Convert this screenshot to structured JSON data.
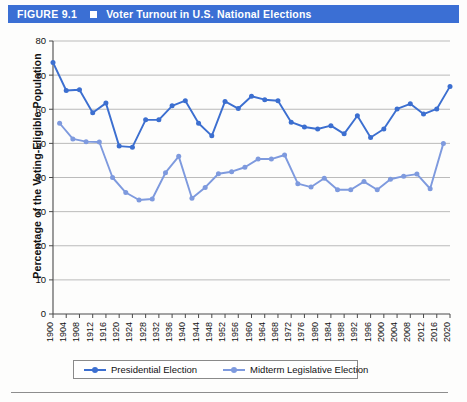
{
  "header": {
    "figure_number": "FIGURE 9.1",
    "marker_icon": "filled-square-icon",
    "title": "Voter Turnout in U.S. National Elections",
    "bar_color": "#3b6fd4"
  },
  "legend": {
    "position": "bottom-center",
    "entries": [
      {
        "label": "Presidential Election",
        "color": "#3c6fd0"
      },
      {
        "label": "Midterm Legislative Election",
        "color": "#7e9ade"
      }
    ]
  },
  "chart_data": {
    "type": "line",
    "title": "Voter Turnout in U.S. National Elections",
    "xlabel": "",
    "ylabel": "Percentage of the Voting-Eligible Population",
    "ylim": [
      0,
      80
    ],
    "ytick_step": 10,
    "yticks": [
      0,
      10,
      20,
      30,
      40,
      50,
      60,
      70,
      80
    ],
    "grid": "horizontal",
    "x": [
      1900,
      1904,
      1908,
      1912,
      1916,
      1920,
      1924,
      1928,
      1932,
      1936,
      1940,
      1944,
      1948,
      1952,
      1956,
      1960,
      1964,
      1968,
      1972,
      1976,
      1980,
      1984,
      1988,
      1992,
      1996,
      2000,
      2004,
      2008,
      2012,
      2016,
      2020
    ],
    "xticks": [
      1900,
      1904,
      1908,
      1912,
      1916,
      1920,
      1924,
      1928,
      1932,
      1936,
      1940,
      1944,
      1948,
      1952,
      1956,
      1960,
      1964,
      1968,
      1972,
      1976,
      1980,
      1984,
      1988,
      1992,
      1996,
      2000,
      2004,
      2008,
      2012,
      2016,
      2020
    ],
    "series": [
      {
        "name": "Presidential Election",
        "color": "#3c6fd0",
        "x": [
          1900,
          1904,
          1908,
          1912,
          1916,
          1920,
          1924,
          1928,
          1932,
          1936,
          1940,
          1944,
          1948,
          1952,
          1956,
          1960,
          1964,
          1968,
          1972,
          1976,
          1980,
          1984,
          1988,
          1992,
          1996,
          2000,
          2004,
          2008,
          2012,
          2016,
          2020
        ],
        "values": [
          73.7,
          65.5,
          65.7,
          59.0,
          61.8,
          49.2,
          48.9,
          56.9,
          56.9,
          61.0,
          62.5,
          55.9,
          52.2,
          62.3,
          60.2,
          63.8,
          62.8,
          62.5,
          56.2,
          54.8,
          54.2,
          55.2,
          52.8,
          58.1,
          51.7,
          54.2,
          60.1,
          61.6,
          58.6,
          60.1,
          66.7
        ]
      },
      {
        "name": "Midterm Legislative Election",
        "color": "#7e9ade",
        "x": [
          1902,
          1906,
          1910,
          1914,
          1918,
          1922,
          1926,
          1930,
          1934,
          1938,
          1942,
          1946,
          1950,
          1954,
          1958,
          1962,
          1966,
          1970,
          1974,
          1978,
          1982,
          1986,
          1990,
          1994,
          1998,
          2002,
          2006,
          2010,
          2014,
          2018
        ],
        "values": [
          55.9,
          51.3,
          50.5,
          50.4,
          40.0,
          35.6,
          33.4,
          33.7,
          41.4,
          46.2,
          33.9,
          37.1,
          41.1,
          41.7,
          43.0,
          45.4,
          45.4,
          46.6,
          38.2,
          37.2,
          39.8,
          36.4,
          36.4,
          38.8,
          36.4,
          39.5,
          40.4,
          41.0,
          36.7,
          50.0
        ]
      }
    ]
  }
}
